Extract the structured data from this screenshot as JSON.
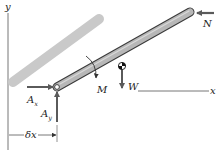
{
  "diagram": {
    "colors": {
      "axis": "#6e6e6e",
      "shadow_bar": "#c9c9c9",
      "bar_fill": "#b7b7b7",
      "bar_outline": "#3a3a3a",
      "force_arrow": "#5a5a5a",
      "text": "#222222"
    },
    "axes": {
      "y_label": "y",
      "x_label": "x"
    },
    "forces": {
      "N": "N",
      "W": "W",
      "M": "M",
      "Ax_main": "A",
      "Ax_sub": "x",
      "Ay_main": "A",
      "Ay_sub": "y"
    },
    "dimension": {
      "label": "δx"
    },
    "symbols": {
      "center_of_gravity": "cg-symbol",
      "pin": "pin-joint"
    }
  }
}
